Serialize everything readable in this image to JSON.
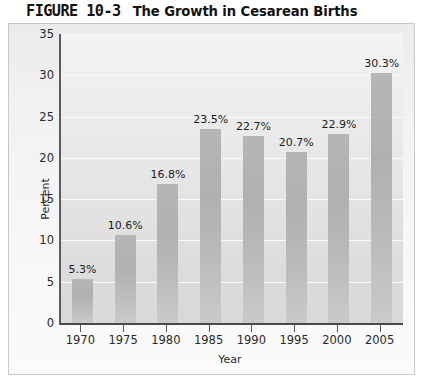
{
  "figure": {
    "number": "FIGURE 10-3",
    "caption": "The Growth in Cesarean Births"
  },
  "colors": {
    "bar": "#b4b4b4",
    "plot_background": "#e8e8e8",
    "card_background": "#f2f2f2",
    "axis": "#4a4a4a",
    "gridline": "#fafafa",
    "text": "#1c1c1c"
  },
  "chart_data": {
    "type": "bar",
    "title": "The Growth in Cesarean Births",
    "xlabel": "Year",
    "ylabel": "Percent",
    "categories": [
      "1970",
      "1975",
      "1980",
      "1985",
      "1990",
      "1995",
      "2000",
      "2005"
    ],
    "values": [
      5.3,
      10.6,
      16.8,
      23.5,
      22.7,
      20.7,
      22.9,
      30.3
    ],
    "data_labels": [
      "5.3%",
      "10.6%",
      "16.8%",
      "23.5%",
      "22.7%",
      "20.7%",
      "22.9%",
      "30.3%"
    ],
    "ylim": [
      0,
      35
    ],
    "yticks": [
      0,
      5,
      10,
      15,
      20,
      25,
      30,
      35
    ],
    "ytick_labels": [
      "0",
      "5",
      "10",
      "15",
      "20",
      "25",
      "30",
      "35"
    ],
    "xtick_labels": [
      "1970",
      "1975",
      "1980",
      "1985",
      "1990",
      "1995",
      "2000",
      "2005"
    ],
    "grid": true,
    "grid_axis": "y",
    "legend": false,
    "legend_position": "none"
  }
}
